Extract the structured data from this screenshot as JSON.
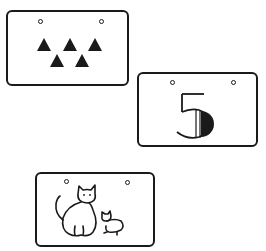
{
  "cards": [
    {
      "id": "triangles-card",
      "content": "five black triangles",
      "shape": "triangle",
      "count": 5,
      "rows": [
        3,
        2
      ]
    },
    {
      "id": "number-card",
      "content": "numeral",
      "numeral": "5"
    },
    {
      "id": "cats-card",
      "content": "large cat and small kitten",
      "animals": [
        "cat",
        "kitten"
      ]
    }
  ],
  "colors": {
    "ink": "#1a1a1a",
    "background": "#ffffff"
  }
}
